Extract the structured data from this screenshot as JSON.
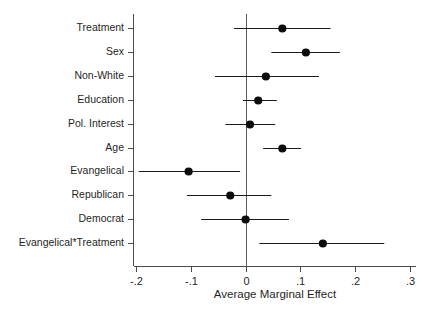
{
  "chart_data": {
    "type": "scatter",
    "title": "",
    "subtitle": "",
    "xlabel": "Average Marginal Effect",
    "ylabel": "",
    "xlim": [
      -0.22,
      0.315
    ],
    "xticks": [
      -0.2,
      -0.1,
      0,
      0.1,
      0.2,
      0.3
    ],
    "xtick_labels": [
      "-.2",
      "-.1",
      "0",
      ".1",
      ".2",
      ".3"
    ],
    "grid": false,
    "legend": null,
    "reference_line": 0,
    "orientation": "horizontal",
    "style": "coefficient-plot-with-confidence-intervals",
    "categories": [
      "Treatment",
      "Sex",
      "Non-White",
      "Education",
      "Pol. Interest",
      "Age",
      "Evangelical",
      "Republican",
      "Democrat",
      "Evangelical*Treatment"
    ],
    "values": [
      0.067,
      0.11,
      0.037,
      0.023,
      0.008,
      0.067,
      -0.104,
      -0.028,
      0.0,
      0.141
    ],
    "ci_low": [
      -0.021,
      0.047,
      -0.056,
      -0.005,
      -0.037,
      0.032,
      -0.195,
      -0.107,
      -0.081,
      0.025
    ],
    "ci_high": [
      0.155,
      0.172,
      0.134,
      0.057,
      0.054,
      0.101,
      -0.01,
      0.047,
      0.079,
      0.253
    ],
    "points": [
      {
        "label": "Treatment",
        "estimate": 0.067,
        "ci_low": -0.021,
        "ci_high": 0.155
      },
      {
        "label": "Sex",
        "estimate": 0.11,
        "ci_low": 0.047,
        "ci_high": 0.172
      },
      {
        "label": "Non-White",
        "estimate": 0.037,
        "ci_low": -0.056,
        "ci_high": 0.134
      },
      {
        "label": "Education",
        "estimate": 0.023,
        "ci_low": -0.005,
        "ci_high": 0.057
      },
      {
        "label": "Pol. Interest",
        "estimate": 0.008,
        "ci_low": -0.037,
        "ci_high": 0.054
      },
      {
        "label": "Age",
        "estimate": 0.067,
        "ci_low": 0.032,
        "ci_high": 0.101
      },
      {
        "label": "Evangelical",
        "estimate": -0.104,
        "ci_low": -0.195,
        "ci_high": -0.01
      },
      {
        "label": "Republican",
        "estimate": -0.028,
        "ci_low": -0.107,
        "ci_high": 0.047
      },
      {
        "label": "Democrat",
        "estimate": 0.0,
        "ci_low": -0.081,
        "ci_high": 0.079
      },
      {
        "label": "Evangelical*Treatment",
        "estimate": 0.141,
        "ci_low": 0.025,
        "ci_high": 0.253
      }
    ],
    "colors": {
      "point": "#0d0d0d",
      "interval": "#1a1a1a",
      "axis": "#4a4a4a",
      "zero_line": "#5a5a5a",
      "background": "#ffffff",
      "text": "#1f1f1f"
    }
  }
}
